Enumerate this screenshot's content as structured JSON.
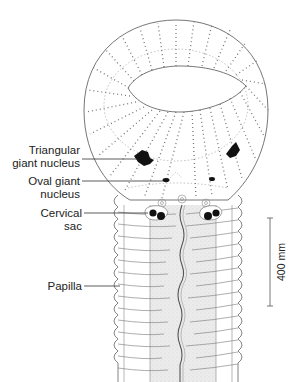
{
  "figure": {
    "labels": {
      "triangular_1": "Triangular",
      "triangular_2": "giant nucleus",
      "oval_1": "Oval giant",
      "oval_2": "nucleus",
      "cervical_1": "Cervical",
      "cervical_2": "sac",
      "papilla": "Papilla"
    },
    "scale_bar": {
      "label": "400 mm"
    },
    "colors": {
      "line": "#555555",
      "dot": "#777777",
      "nucleus": "#111111",
      "body_shade": "#e6e6e6"
    }
  }
}
